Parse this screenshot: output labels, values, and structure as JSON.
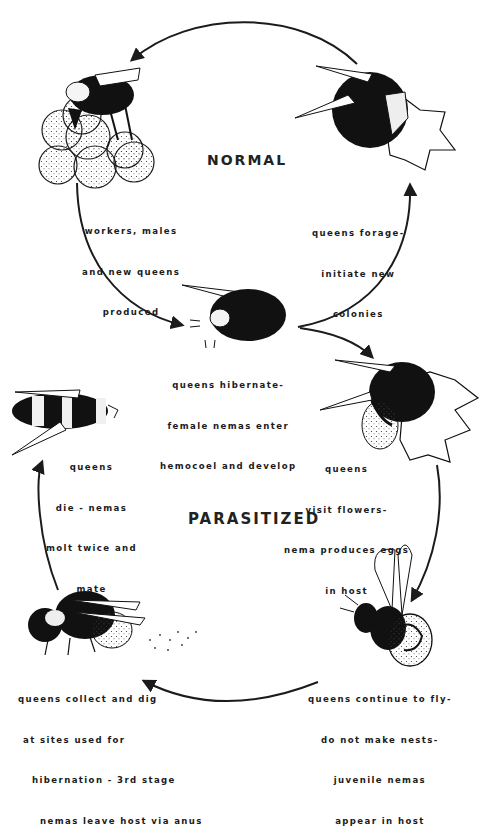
{
  "diagram": {
    "cycles": [
      {
        "title": "NORMAL",
        "stages": [
          {
            "id": "nest",
            "label": [
              "workers, males",
              "and new queens",
              "produced"
            ]
          },
          {
            "id": "hibernate",
            "label": [
              "queens hibernate-",
              "female nemas enter",
              "hemocoel and develop"
            ]
          },
          {
            "id": "forage",
            "label": [
              "queens forage-",
              "initiate new",
              "colonies"
            ]
          }
        ]
      },
      {
        "title": "PARASITIZED",
        "stages": [
          {
            "id": "visit",
            "label": [
              "queens",
              "visit flowers-",
              "nema produces eggs",
              "in host"
            ]
          },
          {
            "id": "fly",
            "label": [
              "queens continue to fly-",
              "do not make nests-",
              "juvenile nemas",
              "appear in host"
            ]
          },
          {
            "id": "dig",
            "label": [
              "queens collect and dig",
              "at sites used for",
              "hibernation - 3rd stage",
              "nemas leave host via anus"
            ]
          },
          {
            "id": "die",
            "label": [
              "queens",
              "die - nemas",
              "molt twice and",
              "mate"
            ]
          }
        ]
      }
    ],
    "colors": {
      "ink": "#1b1b1b",
      "paper": "#ffffff"
    }
  }
}
